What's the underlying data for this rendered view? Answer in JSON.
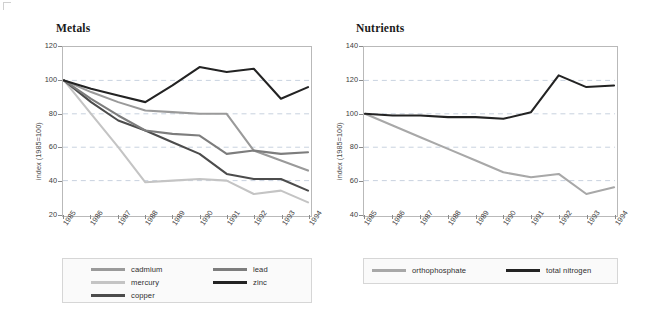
{
  "figure": {
    "background_color": "#ffffff",
    "panels": [
      "Metals",
      "Nutrients"
    ]
  },
  "chart_data": [
    {
      "type": "line",
      "title": "Metals",
      "xlabel": "",
      "ylabel": "index (1985=100)",
      "categories": [
        "1985",
        "1986",
        "1987",
        "1988",
        "1989",
        "1990",
        "1991",
        "1992",
        "1993",
        "1994"
      ],
      "ylim": [
        20,
        120
      ],
      "yticks": [
        20,
        40,
        60,
        80,
        100,
        120
      ],
      "grid": "horizontal-dashed",
      "legend_position": "below-plot",
      "series": [
        {
          "name": "cadmium",
          "color": "#9a9a9a",
          "values": [
            100,
            93,
            87,
            82,
            81,
            80,
            80,
            58,
            52,
            46
          ]
        },
        {
          "name": "mercury",
          "color": "#c4c4c4",
          "values": [
            100,
            80,
            60,
            39,
            40,
            41,
            40,
            32,
            34,
            27
          ]
        },
        {
          "name": "copper",
          "color": "#4c4c4c",
          "values": [
            100,
            87,
            76,
            70,
            63,
            56,
            44,
            41,
            41,
            34
          ]
        },
        {
          "name": "lead",
          "color": "#7d7d7d",
          "values": [
            100,
            89,
            79,
            70,
            68,
            67,
            56,
            58,
            56,
            57
          ]
        },
        {
          "name": "zinc",
          "color": "#232323",
          "values": [
            100,
            95,
            91,
            87,
            97,
            108,
            105,
            107,
            89,
            96
          ]
        }
      ]
    },
    {
      "type": "line",
      "title": "Nutrients",
      "xlabel": "",
      "ylabel": "index (1985=100)",
      "categories": [
        "1985",
        "1986",
        "1987",
        "1988",
        "1989",
        "1990",
        "1991",
        "1992",
        "1993",
        "1994"
      ],
      "ylim": [
        40,
        140
      ],
      "yticks": [
        40,
        60,
        80,
        100,
        120,
        140
      ],
      "grid": "horizontal-dashed",
      "legend_position": "below-plot",
      "series": [
        {
          "name": "orthophosphate",
          "color": "#a8a8a8",
          "values": [
            100,
            93,
            86,
            79,
            72,
            65,
            62,
            64,
            52,
            56
          ]
        },
        {
          "name": "total nitrogen",
          "color": "#232323",
          "values": [
            100,
            99,
            99,
            98,
            98,
            97,
            101,
            123,
            116,
            117
          ]
        }
      ]
    }
  ],
  "metals": {
    "title": "Metals",
    "ylabel": "index (1985=100)",
    "yticks": [
      "120",
      "100",
      "80",
      "60",
      "40",
      "20"
    ],
    "xticks": [
      "1985",
      "1986",
      "1987",
      "1988",
      "1989",
      "1990",
      "1991",
      "1992",
      "1993",
      "1994"
    ],
    "legend": [
      {
        "label": "cadmium",
        "color": "#9a9a9a"
      },
      {
        "label": "mercury",
        "color": "#c4c4c4"
      },
      {
        "label": "copper",
        "color": "#4c4c4c"
      },
      {
        "label": "lead",
        "color": "#7d7d7d"
      },
      {
        "label": "zinc",
        "color": "#232323"
      }
    ]
  },
  "nutrients": {
    "title": "Nutrients",
    "ylabel": "index (1985=100)",
    "yticks": [
      "140",
      "120",
      "100",
      "80",
      "60",
      "40"
    ],
    "xticks": [
      "1985",
      "1986",
      "1987",
      "1988",
      "1989",
      "1990",
      "1991",
      "1992",
      "1993",
      "1994"
    ],
    "legend": [
      {
        "label": "orthophosphate",
        "color": "#a8a8a8"
      },
      {
        "label": "total nitrogen",
        "color": "#232323"
      }
    ]
  }
}
